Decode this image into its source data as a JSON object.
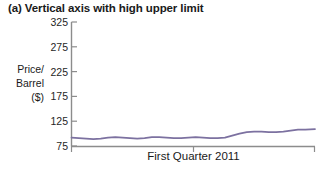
{
  "chart_data": {
    "type": "line",
    "title": "(a) Vertical axis with high upper limit",
    "ylabel_lines": [
      "Price/",
      "Barrel",
      "($)"
    ],
    "ylabel": "Price/ Barrel ($)",
    "xlabel": "First Quarter 2011",
    "ylim": [
      75,
      325
    ],
    "yticks": [
      325,
      275,
      225,
      175,
      125,
      75
    ],
    "ytick_labels": [
      "325",
      "275",
      "225",
      "175",
      "125",
      "75"
    ],
    "xticks": [
      0,
      0.5,
      1
    ],
    "xtick_labels": [
      "",
      "",
      ""
    ],
    "grid": false,
    "legend": null,
    "series": [
      {
        "name": "Crude oil price",
        "color": "#7c71a0",
        "x": [
          0.0,
          0.03,
          0.06,
          0.09,
          0.12,
          0.15,
          0.18,
          0.21,
          0.24,
          0.27,
          0.3,
          0.33,
          0.36,
          0.39,
          0.42,
          0.45,
          0.48,
          0.51,
          0.54,
          0.57,
          0.6,
          0.63,
          0.66,
          0.69,
          0.72,
          0.75,
          0.78,
          0.81,
          0.84,
          0.87,
          0.9,
          0.93,
          0.96,
          1.0
        ],
        "values": [
          92,
          91,
          90,
          89,
          90,
          92,
          93,
          92,
          91,
          90,
          91,
          93,
          93,
          92,
          91,
          91,
          92,
          93,
          92,
          91,
          91,
          92,
          96,
          100,
          103,
          104,
          104,
          103,
          103,
          104,
          106,
          108,
          108,
          109
        ]
      }
    ]
  },
  "axes": {
    "y_axis_name": "price-per-barrel-axis",
    "x_axis_name": "first-quarter-axis"
  }
}
